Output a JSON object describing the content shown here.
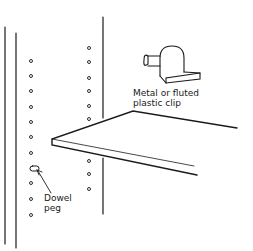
{
  "diagram": {
    "labels": {
      "clip_line1": "Metal or fluted",
      "clip_line2": "plastic clip",
      "peg_line1": "Dowel",
      "peg_line2": "peg"
    },
    "colors": {
      "line": "#1a1a1a",
      "background": "#ffffff"
    },
    "components": [
      "cabinet-side-panel-front",
      "cabinet-side-panel-back",
      "shelf",
      "metal-clip",
      "dowel-peg",
      "shelf-holes"
    ]
  }
}
